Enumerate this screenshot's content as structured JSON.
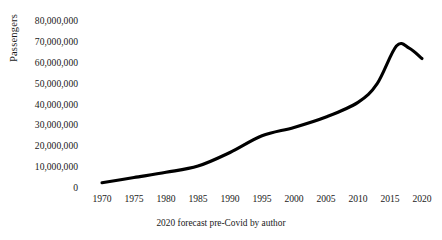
{
  "chart_data": {
    "type": "line",
    "title": "",
    "xlabel": "",
    "ylabel": "Passengers",
    "caption": "2020 forecast pre-Covid by author",
    "grid": false,
    "legend": false,
    "xlim": [
      1970,
      2020
    ],
    "ylim": [
      0,
      80000000
    ],
    "x_ticks": [
      1970,
      1975,
      1980,
      1985,
      1990,
      1995,
      2000,
      2005,
      2010,
      2015,
      2020
    ],
    "x_tick_labels": [
      "1970",
      "1975",
      "1980",
      "1985",
      "1990",
      "1995",
      "2000",
      "2005",
      "2010",
      "2015",
      "2020"
    ],
    "y_ticks": [
      0,
      10000000,
      20000000,
      30000000,
      40000000,
      50000000,
      60000000,
      70000000,
      80000000
    ],
    "y_tick_labels": [
      "0",
      "10,000,000",
      "20,000,000",
      "30,000,000",
      "40,000,000",
      "50,000,000",
      "60,000,000",
      "70,000,000",
      "80,000,000"
    ],
    "series": [
      {
        "name": "Passengers",
        "color": "#000000",
        "x": [
          1970,
          1975,
          1980,
          1985,
          1990,
          1995,
          2000,
          2005,
          2010,
          2013,
          2016,
          2018,
          2020
        ],
        "values": [
          2500000,
          5000000,
          7500000,
          10500000,
          17000000,
          25000000,
          29000000,
          34000000,
          41000000,
          50000000,
          68000000,
          67000000,
          62000000
        ]
      }
    ]
  }
}
